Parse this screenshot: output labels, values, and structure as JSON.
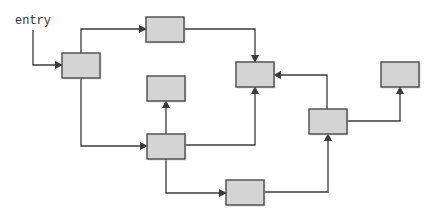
{
  "diagram": {
    "title": "",
    "entry_label": "entry",
    "colors": {
      "node_fill": "#d4d4d4",
      "node_stroke": "#4a4a4a",
      "edge": "#3a3a3a",
      "background": "#ffffff"
    },
    "nodes": [
      {
        "id": "n1",
        "label": "",
        "x": 62,
        "y": 53,
        "w": 38,
        "h": 25
      },
      {
        "id": "n2",
        "label": "",
        "x": 146,
        "y": 17,
        "w": 38,
        "h": 25
      },
      {
        "id": "n3",
        "label": "",
        "x": 236,
        "y": 62,
        "w": 38,
        "h": 25
      },
      {
        "id": "n4",
        "label": "",
        "x": 147,
        "y": 76,
        "w": 38,
        "h": 25
      },
      {
        "id": "n5",
        "label": "",
        "x": 147,
        "y": 134,
        "w": 38,
        "h": 25
      },
      {
        "id": "n6",
        "label": "",
        "x": 226,
        "y": 180,
        "w": 38,
        "h": 25
      },
      {
        "id": "n7",
        "label": "",
        "x": 309,
        "y": 109,
        "w": 38,
        "h": 25
      },
      {
        "id": "n8",
        "label": "",
        "x": 381,
        "y": 62,
        "w": 38,
        "h": 25
      }
    ],
    "edges": [
      {
        "from": "entry",
        "to": "n1",
        "points": [
          [
            33,
            30
          ],
          [
            33,
            65
          ],
          [
            62,
            65
          ]
        ]
      },
      {
        "from": "n1",
        "to": "n2",
        "points": [
          [
            81,
            53
          ],
          [
            81,
            29
          ],
          [
            146,
            29
          ]
        ]
      },
      {
        "from": "n2",
        "to": "n3",
        "points": [
          [
            184,
            29
          ],
          [
            255,
            29
          ],
          [
            255,
            62
          ]
        ]
      },
      {
        "from": "n1",
        "to": "n5",
        "points": [
          [
            81,
            78
          ],
          [
            81,
            146
          ],
          [
            147,
            146
          ]
        ]
      },
      {
        "from": "n5",
        "to": "n4",
        "points": [
          [
            166,
            134
          ],
          [
            166,
            101
          ]
        ]
      },
      {
        "from": "n5",
        "to": "n3",
        "points": [
          [
            185,
            145
          ],
          [
            255,
            145
          ],
          [
            255,
            87
          ]
        ]
      },
      {
        "from": "n5",
        "to": "n6",
        "points": [
          [
            166,
            159
          ],
          [
            166,
            193
          ],
          [
            226,
            193
          ]
        ]
      },
      {
        "from": "n6",
        "to": "n7",
        "points": [
          [
            264,
            192
          ],
          [
            328,
            192
          ],
          [
            328,
            134
          ]
        ]
      },
      {
        "from": "n7",
        "to": "n3",
        "points": [
          [
            327,
            109
          ],
          [
            327,
            75
          ],
          [
            274,
            75
          ]
        ]
      },
      {
        "from": "n7",
        "to": "n8",
        "points": [
          [
            347,
            121
          ],
          [
            400,
            121
          ],
          [
            400,
            87
          ]
        ]
      }
    ]
  }
}
